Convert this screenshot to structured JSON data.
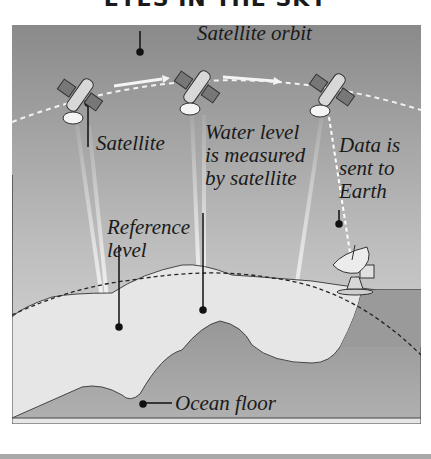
{
  "title": "EYES IN THE SKY",
  "labels": {
    "satellite_orbit": "Satellite orbit",
    "satellite": "Satellite",
    "water_level_line1": "Water level",
    "water_level_line2": "is measured",
    "water_level_line3": "by satellite",
    "data_line1": "Data is",
    "data_line2": "sent to",
    "data_line3": "Earth",
    "reference_line1": "Reference",
    "reference_line2": "level",
    "ocean_floor": "Ocean floor"
  },
  "elements": {
    "satellites": [
      "satellite-left",
      "satellite-middle",
      "satellite-right"
    ],
    "ground_station": "satellite-dish",
    "orbit_path": "dashed-arc",
    "reference_level": "dashed-curve",
    "motion_arrows": 2
  },
  "colors": {
    "sky_top": "#8a8a8a",
    "sky_bottom": "#dcdcdc",
    "water": "#e6e6e6",
    "seafloor": "#9c9c9c",
    "ink": "#1a1a1a"
  }
}
